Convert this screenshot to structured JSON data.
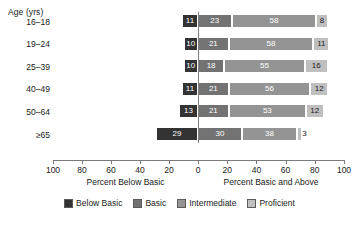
{
  "chart_data": {
    "type": "bar",
    "subtype": "diverging-stacked-bar",
    "title": "",
    "xlabel_left": "Percent Below Basic",
    "xlabel_right": "Percent Basic and Above",
    "ylabel": "Age (yrs)",
    "grid": false,
    "legend_position": "bottom",
    "axis": {
      "left_max": 100,
      "right_max": 100,
      "ticks_left": [
        100,
        80,
        60,
        40,
        20
      ],
      "zero_tick": 0,
      "ticks_right": [
        20,
        40,
        60,
        80,
        100
      ],
      "tick_labels": [
        "100",
        "80",
        "60",
        "40",
        "20",
        "0",
        "20",
        "40",
        "60",
        "80",
        "100"
      ]
    },
    "categories": [
      "16–18",
      "19–24",
      "25–39",
      "40–49",
      "50–64",
      "≥65"
    ],
    "series": [
      {
        "name": "Below Basic",
        "side": "left",
        "color": "#333333",
        "values": [
          11,
          10,
          10,
          11,
          13,
          29
        ]
      },
      {
        "name": "Basic",
        "side": "right",
        "color": "#737373",
        "values": [
          23,
          21,
          18,
          21,
          21,
          30
        ]
      },
      {
        "name": "Intermediate",
        "side": "right",
        "color": "#949494",
        "values": [
          58,
          58,
          55,
          56,
          53,
          38
        ]
      },
      {
        "name": "Proficient",
        "side": "right",
        "color": "#bfbfbf",
        "values": [
          8,
          11,
          16,
          12,
          12,
          3
        ]
      }
    ],
    "legend": [
      {
        "label": "Below Basic",
        "color": "#333333"
      },
      {
        "label": "Basic",
        "color": "#737373"
      },
      {
        "label": "Intermediate",
        "color": "#949494"
      },
      {
        "label": "Proficient",
        "color": "#bfbfbf"
      }
    ]
  }
}
